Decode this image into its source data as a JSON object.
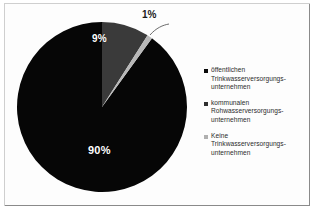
{
  "chart_data": {
    "type": "pie",
    "title": "",
    "categories": [
      "öffentlichen Trinkwasserversorgungsunternehmen",
      "kommunalen Rohwasserversorgungsunternehmen",
      "Keine Trinkwasserversorgungsunternehmen"
    ],
    "values": [
      90,
      9,
      1
    ],
    "value_labels": [
      "90%",
      "9%",
      "1%"
    ],
    "colors": [
      "#060606",
      "#3a3a3a",
      "#b8b8b8"
    ],
    "legend_position": "right",
    "grid": false
  },
  "pie": {
    "slices": [
      {
        "label": "90%",
        "value": 90,
        "color": "#060606"
      },
      {
        "label": "9%",
        "value": 9,
        "color": "#3a3a3a"
      },
      {
        "label": "1%",
        "value": 1,
        "color": "#b8b8b8"
      }
    ]
  },
  "legend": {
    "entries": [
      {
        "swatch_color": "#0a0a0a",
        "line1": "öffentlichen",
        "line2": "Trinkwasserversorgungs-",
        "line3": "unternehmen"
      },
      {
        "swatch_color": "#2f2f2f",
        "line1": "kommunalen",
        "line2": "Rohwasserversorgungs-",
        "line3": "unternehmen"
      },
      {
        "swatch_color": "#b0b0b0",
        "line1": "Keine",
        "line2": "Trinkwasserversorgungs-",
        "line3": "unternehmen"
      }
    ]
  }
}
